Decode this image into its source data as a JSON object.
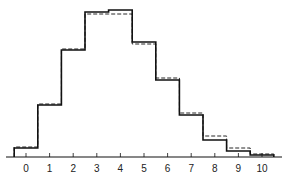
{
  "chart_data": {
    "type": "line",
    "subtype": "step-histogram",
    "title": "",
    "xlabel": "",
    "ylabel": "",
    "categories": [
      "0",
      "1",
      "2",
      "3",
      "4",
      "5",
      "6",
      "7",
      "8",
      "9",
      "10"
    ],
    "series": [
      {
        "name": "observed",
        "style": "solid",
        "values": [
          9,
          52,
          107,
          145,
          147,
          115,
          77,
          42,
          17,
          6,
          2
        ]
      },
      {
        "name": "expected",
        "style": "dashed",
        "values": [
          10,
          53,
          108,
          143,
          143,
          113,
          79,
          44,
          21,
          9,
          3
        ]
      }
    ],
    "ylim": [
      0,
      150
    ],
    "grid": false,
    "legend": "none"
  },
  "axis": {
    "tick_labels": [
      "0",
      "1",
      "2",
      "3",
      "4",
      "5",
      "6",
      "7",
      "8",
      "9",
      "10"
    ]
  }
}
